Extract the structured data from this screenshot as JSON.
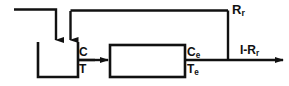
{
  "diagram": {
    "stroke_color": "#111111",
    "background_color": "#ffffff",
    "labels": {
      "recycle": {
        "base": "R",
        "sub": "r"
      },
      "tank_outlet_concentration": {
        "base": "C",
        "sub": ""
      },
      "tank_outlet_temperature": {
        "base": "T",
        "sub": ""
      },
      "reactor_exit_concentration": {
        "base": "C",
        "sub": "e"
      },
      "reactor_exit_temperature": {
        "base": "T",
        "sub": "e"
      },
      "product_stream": {
        "base": "I-R",
        "sub": "r"
      }
    },
    "nodes": {
      "mixing_tank": {
        "name": "mixing-tank",
        "x": 38,
        "y": 42,
        "width": 40,
        "height": 36
      },
      "reactor": {
        "name": "reactor-box",
        "x": 110,
        "y": 45,
        "width": 75,
        "height": 32
      }
    }
  }
}
